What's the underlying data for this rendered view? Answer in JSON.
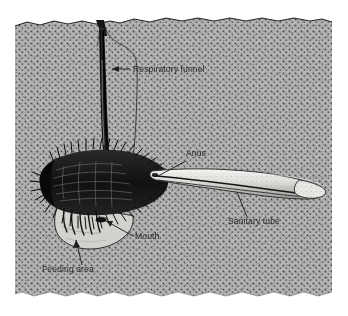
{
  "figure": {
    "type": "scientific-illustration",
    "background_color": "#ffffff",
    "sediment_color": "#b4b4b4",
    "stipple_color": "#3a3a3a",
    "ink_color": "#1a1a1a",
    "label_color": "#2b2b2b",
    "frame": {
      "left": 15,
      "top": 17,
      "right": 332,
      "bottom": 298
    }
  },
  "labels": [
    {
      "id": "respiratory-funnel",
      "text": "Respiratory funnel",
      "x": 133,
      "y": 72,
      "anchor": "start"
    },
    {
      "id": "anus",
      "text": "Anus",
      "x": 186,
      "y": 156,
      "anchor": "start"
    },
    {
      "id": "sanitary-tube",
      "text": "Sanitary tube",
      "x": 228,
      "y": 224,
      "anchor": "start"
    },
    {
      "id": "mouth",
      "text": "Mouth",
      "x": 135,
      "y": 239,
      "anchor": "start"
    },
    {
      "id": "feeding-area",
      "text": "Feeding area",
      "x": 42,
      "y": 272,
      "anchor": "start"
    }
  ],
  "parts": [
    {
      "id": "respiratory-funnel-shaft",
      "name": "Respiratory funnel"
    },
    {
      "id": "worm-body",
      "name": "Bristled worm body"
    },
    {
      "id": "sanitary-tube-body",
      "name": "Sanitary tube"
    },
    {
      "id": "feeding-cavity",
      "name": "Feeding area cavity"
    },
    {
      "id": "mouth-opening",
      "name": "Mouth"
    },
    {
      "id": "anus-opening",
      "name": "Anus"
    },
    {
      "id": "sediment",
      "name": "Sediment / substrate"
    }
  ]
}
